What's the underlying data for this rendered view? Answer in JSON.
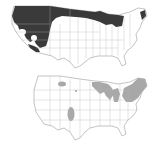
{
  "figure": {
    "panels": [
      {
        "id": "top",
        "description": "US map with dark-shaded region over the northern and western states",
        "shade_color": "#3a3a3a",
        "shaded_regions": [
          "Pacific Northwest",
          "Northern Rockies",
          "Great Basin",
          "Northern Plains",
          "Upper Midwest",
          "Southwest (Arizona)",
          "Maine"
        ]
      },
      {
        "id": "bottom",
        "description": "US map with light gray-shaded regions in the Northeast, Great Lakes, and isolated western areas",
        "shade_color": "#a8a8a8",
        "shaded_regions": [
          "New England",
          "New York",
          "Great Lakes (Michigan, Wisconsin, Minnesota)",
          "Colorado/New Mexico",
          "Montana"
        ]
      }
    ],
    "outline_color": "#9a9a9a",
    "background": "#ffffff"
  }
}
